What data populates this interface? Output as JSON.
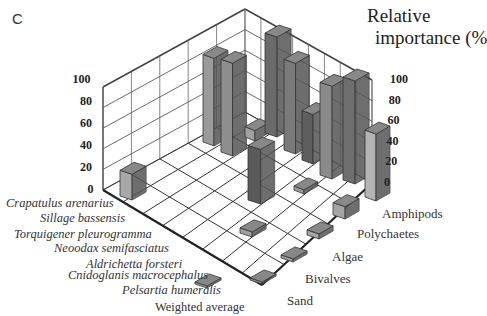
{
  "panel_letter": "C",
  "chart_data": {
    "type": "bar3d",
    "title": "",
    "zlabel": "Relative importance (%",
    "zlim": [
      0,
      100
    ],
    "zticks": [
      "0",
      "20",
      "40",
      "60",
      "80",
      "100"
    ],
    "species": [
      "Crapatulus arenarius",
      "Sillage bassensis",
      "Torquigener pleurogramma",
      "Neoodax semifasciatus",
      "Aldrichetta forsteri",
      "Cnidoglanis macrocephalus",
      "Pelsartia humeralis",
      "Weighted average"
    ],
    "prey": [
      "Amphipods",
      "Polychaetes",
      "Algae",
      "Bivalves",
      "Sand"
    ],
    "bars": [
      {
        "label": "bar-1",
        "value": 25,
        "x": 120,
        "y": 196,
        "w": 22,
        "shade": "#a8a8a8"
      },
      {
        "label": "bar-2",
        "value": 85,
        "x": 203,
        "y": 142,
        "w": 20,
        "shade": "#9a9a9a"
      },
      {
        "label": "bar-3",
        "value": 90,
        "x": 221,
        "y": 152,
        "w": 21,
        "shade": "#8e8e8e"
      },
      {
        "label": "bar-4",
        "value": 10,
        "x": 245,
        "y": 137,
        "w": 18,
        "shade": "#a0a0a0"
      },
      {
        "label": "bar-5",
        "value": 97,
        "x": 265,
        "y": 133,
        "w": 22,
        "shade": "#6a6a6a"
      },
      {
        "label": "bar-6",
        "value": 88,
        "x": 284,
        "y": 150,
        "w": 21,
        "shade": "#7a7a7a"
      },
      {
        "label": "bar-7",
        "value": 48,
        "x": 302,
        "y": 160,
        "w": 20,
        "shade": "#5e5e5e"
      },
      {
        "label": "bar-8",
        "value": 90,
        "x": 320,
        "y": 175,
        "w": 22,
        "shade": "#8a8a8a"
      },
      {
        "label": "bar-9",
        "value": 100,
        "x": 343,
        "y": 180,
        "w": 22,
        "shade": "#6e6e6e"
      },
      {
        "label": "bar-10",
        "value": 65,
        "x": 365,
        "y": 197,
        "w": 20,
        "shade": "#b4b4b4"
      },
      {
        "label": "bar-11",
        "value": 53,
        "x": 248,
        "y": 200,
        "w": 23,
        "shade": "#5a5a5a"
      },
      {
        "label": "bar-12",
        "value": 4,
        "x": 294,
        "y": 190,
        "w": 18,
        "shade": "#9c9c9c"
      },
      {
        "label": "bar-13",
        "value": 12,
        "x": 333,
        "y": 215,
        "w": 22,
        "shade": "#a4a4a4"
      },
      {
        "label": "bar-14",
        "value": 5,
        "x": 240,
        "y": 233,
        "w": 22,
        "shade": "#a0a0a0"
      },
      {
        "label": "bar-15",
        "value": 5,
        "x": 307,
        "y": 235,
        "w": 22,
        "shade": "#a4a4a4"
      },
      {
        "label": "bar-16",
        "value": 3,
        "x": 281,
        "y": 258,
        "w": 22,
        "shade": "#a0a0a0"
      },
      {
        "label": "bar-17",
        "value": 2,
        "x": 250,
        "y": 280,
        "w": 22,
        "shade": "#9a9a9a"
      },
      {
        "label": "bar-18",
        "value": 2,
        "x": 195,
        "y": 284,
        "w": 22,
        "shade": "#a0a0a0"
      }
    ]
  }
}
